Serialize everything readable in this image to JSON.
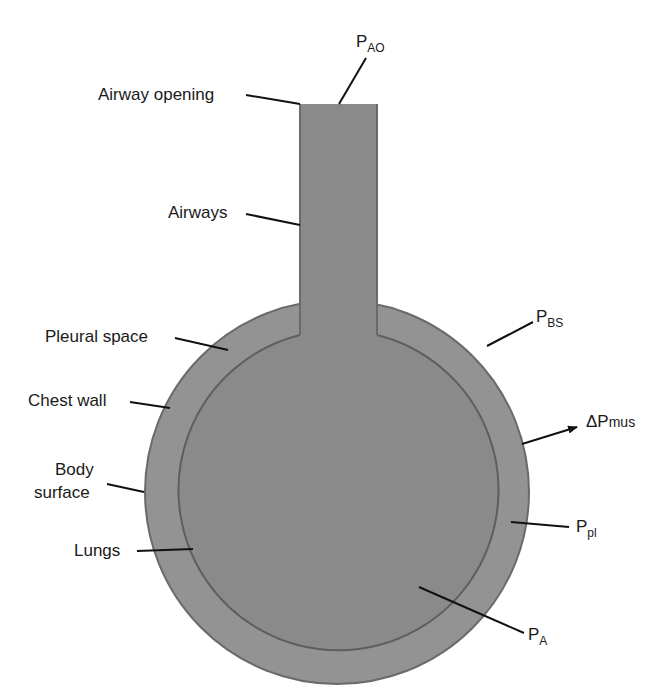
{
  "colors": {
    "chest_wall_fill": "#939393",
    "lung_fill": "#8a8a8a",
    "outline": "#666666",
    "leader": "#111111",
    "background": "#ffffff"
  },
  "labels": {
    "airway_opening": "Airway opening",
    "airways": "Airways",
    "pleural_space": "Pleural space",
    "chest_wall": "Chest wall",
    "body_surface_line1": "Body",
    "body_surface_line2": "surface",
    "lungs": "Lungs"
  },
  "pressures": {
    "p_ao": {
      "main": "P",
      "sub": "AO"
    },
    "p_bs": {
      "main": "P",
      "sub": "BS"
    },
    "delta_p_mus": {
      "main": "ΔP",
      "sub": "mus"
    },
    "p_pl": {
      "main": "P",
      "sub": "pl"
    },
    "p_a": {
      "main": "P",
      "sub": "A"
    }
  }
}
